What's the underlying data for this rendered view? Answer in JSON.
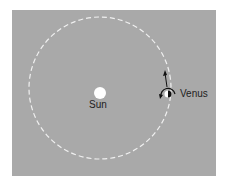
{
  "diagram": {
    "title": "",
    "background_color": "#a9a9a9",
    "orbit_color": "#f0f0f0",
    "sun": {
      "label": "Sun",
      "color": "#ffffff"
    },
    "venus": {
      "label": "Venus",
      "lit_color": "#ffffff",
      "dark_color": "#111111"
    },
    "motion": {
      "orbit_direction": "counterclockwise-up",
      "rotation_arrow": "retrograde"
    }
  }
}
